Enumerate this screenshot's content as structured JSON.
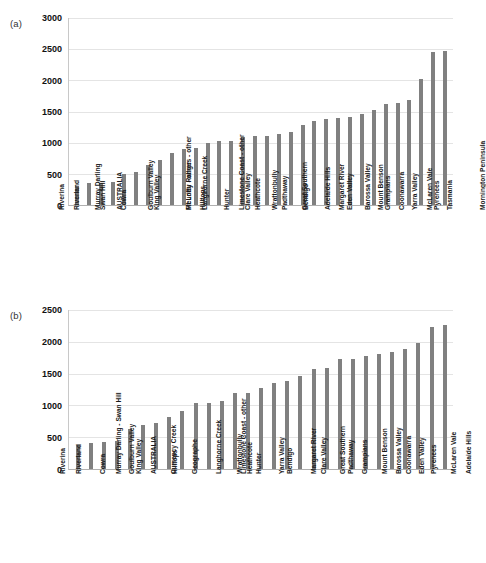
{
  "figure": {
    "background": "#ffffff",
    "bar_color": "#808080",
    "grid_color": "#e4e4e4",
    "axis_color": "#b0b0b0"
  },
  "panels": [
    {
      "key": "a",
      "label": "(a)"
    },
    {
      "key": "b",
      "label": "(b)"
    }
  ],
  "chart_data": [
    {
      "panel": "(a)",
      "type": "bar",
      "title": "",
      "xlabel": "",
      "ylabel": "",
      "ylim": [
        0,
        3000
      ],
      "yticks": [
        0,
        500,
        1000,
        1500,
        2000,
        2500,
        3000
      ],
      "ytick_labels": [
        "0",
        "500",
        "1000",
        "1500",
        "2000",
        "2500",
        "3000"
      ],
      "grid": true,
      "legend": "none",
      "orientation": "vertical",
      "categories": [
        "Riverina",
        "Riverland",
        "Murray Darling",
        "Swan Hill",
        "AUSTRALIA",
        "Cowra",
        "Goulburn Valley",
        "King Valley",
        "Mt Lofty Ranges - other",
        "Fleurieu - other",
        "Langhorne Creek",
        "Hilltops",
        "Limestone Coast - other",
        "Hunter",
        "Clare Valley",
        "Heathcote",
        "Wrattonbully",
        "Padthaway",
        "Great Southern",
        "Bendigo",
        "Adelaide Hills",
        "Margaret River",
        "Eden Valley",
        "Barossa Valley",
        "Mount Benson",
        "Grampians",
        "Coonawarra",
        "Yarra Valley",
        "McLaren Vale",
        "Pyrenees",
        "Tasmania",
        "Mornington Peninsula"
      ],
      "values": [
        310,
        355,
        360,
        365,
        505,
        530,
        640,
        715,
        835,
        895,
        910,
        995,
        1020,
        1035,
        1090,
        1105,
        1115,
        1140,
        1170,
        1285,
        1340,
        1385,
        1400,
        1415,
        1455,
        1525,
        1620,
        1630,
        1680,
        2015,
        2460,
        2465
      ]
    },
    {
      "panel": "(b)",
      "type": "bar",
      "title": "",
      "xlabel": "",
      "ylabel": "",
      "ylim": [
        0,
        2500
      ],
      "yticks": [
        0,
        500,
        1000,
        1500,
        2000,
        2500
      ],
      "ytick_labels": [
        "0",
        "500",
        "1000",
        "1500",
        "2000",
        "2500"
      ],
      "grid": true,
      "legend": "none",
      "orientation": "vertical",
      "categories": [
        "Riverina",
        "Riverland",
        "Murray Darling - Swan Hill",
        "Cowra",
        "Goulburn Valley",
        "King Valley",
        "AUSTRALIA",
        "Currency Creek",
        "Hilltops",
        "Geographe",
        "Langhorne Creek",
        "Limestone Coast - other",
        "Wrattonbully",
        "Heathcote",
        "Hunter",
        "Yarra Valley",
        "Bendigo",
        "Margaret River",
        "Clare Valley",
        "Great Southern",
        "Padthaway",
        "Grampians",
        "Mount Benson",
        "Barossa Valley",
        "Coonawarra",
        "Eden Valley",
        "Pyrenees",
        "McLaren Vale",
        "Adelaide Hills"
      ],
      "values": [
        380,
        415,
        430,
        440,
        635,
        685,
        720,
        820,
        910,
        1045,
        1045,
        1070,
        1190,
        1200,
        1280,
        1360,
        1385,
        1470,
        1570,
        1595,
        1730,
        1730,
        1770,
        1810,
        1840,
        1885,
        1980,
        2235,
        2265
      ]
    }
  ]
}
